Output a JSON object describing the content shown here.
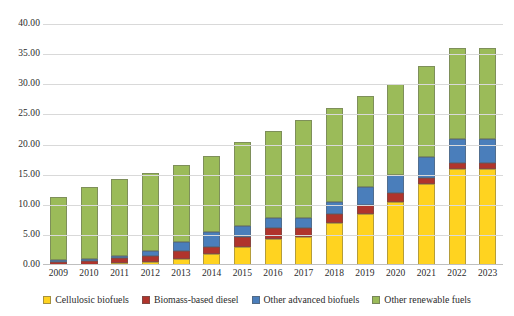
{
  "chart_data": {
    "type": "bar",
    "stacked": true,
    "title": "",
    "xlabel": "",
    "ylabel": "",
    "ylim": [
      0,
      40
    ],
    "ytick_step": 5,
    "grid": true,
    "legend_position": "bottom",
    "categories": [
      "2009",
      "2010",
      "2011",
      "2012",
      "2013",
      "2014",
      "2015",
      "2016",
      "2017",
      "2018",
      "2019",
      "2020",
      "2021",
      "2022",
      "2023"
    ],
    "yticks": [
      "0.00",
      "5.00",
      "10.00",
      "15.00",
      "20.00",
      "25.00",
      "30.00",
      "35.00",
      "40.00"
    ],
    "series": [
      {
        "name": "Cellulosic biofuels",
        "color": "#FFD320",
        "values": [
          0.0,
          0.0,
          0.01,
          0.5,
          1.0,
          1.75,
          3.0,
          4.25,
          4.6,
          7.0,
          8.5,
          10.5,
          13.5,
          16.0,
          16.0
        ]
      },
      {
        "name": "Biomass-based diesel",
        "color": "#B0342C",
        "values": [
          0.5,
          0.65,
          0.8,
          1.0,
          1.28,
          1.28,
          1.63,
          1.9,
          1.5,
          1.5,
          1.5,
          1.5,
          1.0,
          1.0,
          1.0
        ]
      },
      {
        "name": "Other advanced biofuels",
        "color": "#4A7EBB",
        "values": [
          0.1,
          0.3,
          0.44,
          0.75,
          1.47,
          2.42,
          1.87,
          1.6,
          1.7,
          2.0,
          3.0,
          3.0,
          3.5,
          4.0,
          4.0
        ]
      },
      {
        "name": "Other renewable fuels",
        "color": "#9BBB59",
        "values": [
          10.5,
          12.0,
          12.7,
          12.95,
          12.8,
          12.7,
          14.0,
          14.5,
          16.2,
          15.5,
          15.0,
          15.0,
          15.0,
          15.0,
          15.0
        ]
      }
    ],
    "totals": [
      11.1,
      12.95,
      13.95,
      15.2,
      16.55,
      18.15,
      20.5,
      22.25,
      24.0,
      26.0,
      28.0,
      30.0,
      33.0,
      36.0,
      36.0
    ]
  },
  "legend": {
    "items": [
      {
        "label": "Cellulosic biofuels"
      },
      {
        "label": "Biomass-based diesel"
      },
      {
        "label": "Other advanced biofuels"
      },
      {
        "label": "Other renewable fuels"
      }
    ]
  }
}
